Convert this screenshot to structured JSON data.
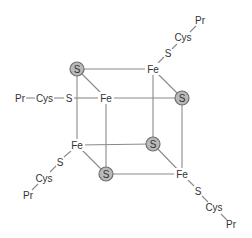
{
  "diagram": {
    "colors": {
      "bond": "#8a8a8a",
      "sulfur_fill": "#b9b9b9",
      "sulfur_stroke": "#6f6f6f",
      "text": "#333333"
    },
    "cluster": {
      "sulfurs": [
        {
          "id": "s1",
          "label": "S",
          "x": 77,
          "y": 69
        },
        {
          "id": "s2",
          "label": "S",
          "x": 182,
          "y": 98
        },
        {
          "id": "s3",
          "label": "S",
          "x": 153,
          "y": 144
        },
        {
          "id": "s4",
          "label": "S",
          "x": 106,
          "y": 174
        }
      ],
      "irons": [
        {
          "id": "fe1",
          "label": "Fe",
          "x": 153,
          "y": 69
        },
        {
          "id": "fe2",
          "label": "Fe",
          "x": 106,
          "y": 98
        },
        {
          "id": "fe3",
          "label": "Fe",
          "x": 77,
          "y": 145
        },
        {
          "id": "fe4",
          "label": "Fe",
          "x": 182,
          "y": 174
        }
      ]
    },
    "ligands": {
      "top": {
        "s": "S",
        "cys": "Cys",
        "pr": "Pr"
      },
      "left": {
        "s": "S",
        "cys": "Cys",
        "pr": "Pr"
      },
      "bottom_left": {
        "s": "S",
        "cys": "Cys",
        "pr": "Pr"
      },
      "bottom_right": {
        "s": "S",
        "cys": "Cys",
        "pr": "Pr"
      }
    }
  }
}
